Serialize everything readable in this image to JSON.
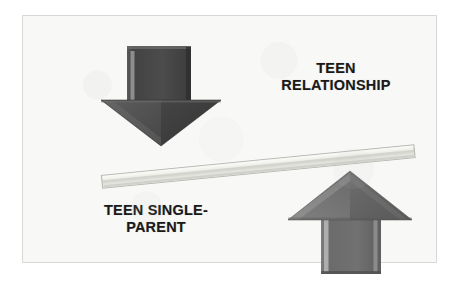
{
  "diagram": {
    "type": "balance-lever",
    "background_color": "#f8f8f6",
    "border_color": "#d8d8d6",
    "labels": {
      "right_label": "TEEN\nRELATIONSHIP",
      "left_label": "TEEN SINGLE-\nPARENT",
      "text_color": "#1a1a1a"
    },
    "elements": {
      "down_arrow": {
        "name": "down-arrow",
        "direction": "down",
        "color": "#4a4a4a",
        "highlight_color": "#8d8d8d",
        "shadow_color": "#2f2f2f",
        "associated_label": "TEEN SINGLE-PARENT",
        "side": "left"
      },
      "up_arrow": {
        "name": "up-arrow",
        "direction": "up",
        "color": "#6e6e6e",
        "highlight_color": "#a9a9a9",
        "shadow_color": "#565656",
        "associated_label": "TEEN RELATIONSHIP",
        "side": "right"
      },
      "beam": {
        "name": "lever-beam",
        "color": "#dcdcd6",
        "highlight_color": "#f2f2ee",
        "shadow_color": "#b4b4ae",
        "tilt": "right-side-up",
        "orientation": "tilted"
      }
    }
  }
}
